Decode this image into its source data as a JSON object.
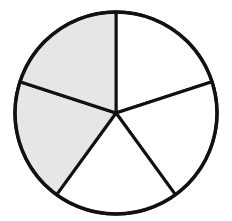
{
  "chart_data": {
    "type": "pie",
    "title": "",
    "categories": [
      "Slice 1",
      "Slice 2",
      "Slice 3",
      "Slice 4",
      "Slice 5"
    ],
    "values": [
      1,
      1,
      1,
      1,
      1
    ],
    "shaded": [
      false,
      false,
      false,
      true,
      true
    ],
    "shaded_fraction": "2/5",
    "colors": {
      "shaded": "#e6e6e6",
      "unshaded": "#ffffff",
      "stroke": "#111111"
    }
  },
  "geometry": {
    "cx": 116,
    "cy": 113,
    "r": 101,
    "start_angle_deg": 0
  }
}
